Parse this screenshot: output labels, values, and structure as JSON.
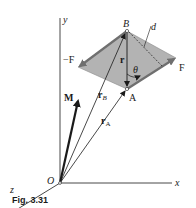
{
  "figure": {
    "caption": "Fig. 3.31",
    "colors": {
      "plane_fill": "#b3b3b3",
      "plane_edge": "#7d7d7d",
      "ink": "#1a1a1a"
    },
    "axes": {
      "x_label": "x",
      "y_label": "y",
      "z_label": "z",
      "origin_label": "O"
    },
    "points": {
      "A": "A",
      "B": "B"
    },
    "vectors": {
      "M": "M",
      "r_A": {
        "base": "r",
        "sub": "A"
      },
      "r_B": {
        "base": "r",
        "sub": "B"
      },
      "r": "r"
    },
    "forces": {
      "F": "F",
      "neg_F": "−F"
    },
    "annotations": {
      "d": "d",
      "theta": "θ"
    }
  }
}
